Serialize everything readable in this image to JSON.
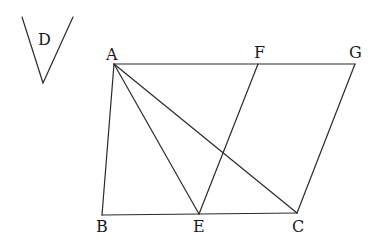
{
  "diagram": {
    "type": "geometry",
    "angle_D": {
      "label": "D",
      "left_top": [
        22,
        17
      ],
      "vertex": [
        43,
        83
      ],
      "right_top": [
        73,
        17
      ],
      "label_pos": [
        38,
        45
      ]
    },
    "points": {
      "A": {
        "label": "A",
        "x": 114,
        "y": 64,
        "lx": 106,
        "ly": 60
      },
      "F": {
        "label": "F",
        "x": 258,
        "y": 64,
        "lx": 254,
        "ly": 58
      },
      "G": {
        "label": "G",
        "x": 355,
        "y": 64,
        "lx": 349,
        "ly": 58
      },
      "B": {
        "label": "B",
        "x": 102,
        "y": 215,
        "lx": 96,
        "ly": 232
      },
      "E": {
        "label": "E",
        "x": 199,
        "y": 214,
        "lx": 193,
        "ly": 232
      },
      "C": {
        "label": "C",
        "x": 297,
        "y": 213,
        "lx": 292,
        "ly": 232
      }
    },
    "segments": [
      [
        "A",
        "G"
      ],
      [
        "A",
        "B"
      ],
      [
        "B",
        "C"
      ],
      [
        "C",
        "G"
      ],
      [
        "A",
        "E"
      ],
      [
        "A",
        "C"
      ],
      [
        "E",
        "F"
      ]
    ]
  }
}
